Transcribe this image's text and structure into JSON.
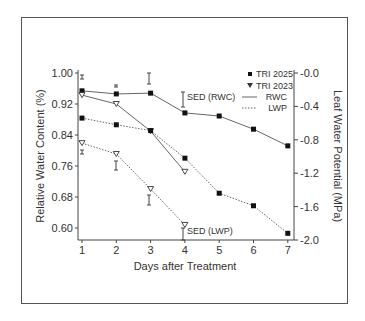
{
  "chart_data": {
    "type": "line",
    "title": "",
    "xlabel": "Days after Treatment",
    "ylabel": "Relative Water Content (%)",
    "y2label": "Leaf Water Potential (MPa)",
    "x": [
      1,
      2,
      3,
      4,
      5,
      6,
      7
    ],
    "x_ticks": [
      "1",
      "2",
      "3",
      "4",
      "5",
      "6",
      "7"
    ],
    "ylim": [
      0.6,
      1.0
    ],
    "y_ticks": [
      "1.00",
      "0.92",
      "0.84",
      "0.76",
      "0.68",
      "0.60"
    ],
    "y2lim": [
      -2.0,
      0.0
    ],
    "y2_ticks": [
      "-0.0",
      "-0.4",
      "-0.8",
      "-1.2",
      "-1.6",
      "-2.0"
    ],
    "grid": false,
    "legend_position": "upper right",
    "legend": [
      {
        "label": "TRI 2025",
        "marker": "square"
      },
      {
        "label": "TRI 2023",
        "marker": "triangle-down"
      },
      {
        "label": "RWC",
        "line": "solid"
      },
      {
        "label": "LWP",
        "line": "dotted"
      }
    ],
    "series": [
      {
        "name": "TRI 2025 RWC",
        "axis": "left",
        "x": [
          1,
          2,
          3,
          4,
          5,
          6,
          7
        ],
        "values": [
          0.954,
          0.946,
          0.948,
          0.897,
          0.889,
          0.855,
          0.812
        ]
      },
      {
        "name": "TRI 2023 RWC",
        "axis": "left",
        "x": [
          1,
          2,
          3,
          4
        ],
        "values": [
          0.943,
          0.92,
          0.85,
          0.745
        ]
      },
      {
        "name": "TRI 2025 LWP",
        "axis": "right",
        "x": [
          1,
          2,
          3,
          4,
          5,
          6,
          7
        ],
        "values": [
          -0.54,
          -0.62,
          -0.69,
          -1.02,
          -1.44,
          -1.59,
          -1.92
        ]
      },
      {
        "name": "TRI 2023 LWP",
        "axis": "right",
        "x": [
          1,
          2,
          3,
          4
        ],
        "values": [
          -0.84,
          -0.97,
          -1.39,
          -1.82
        ]
      }
    ],
    "annotations": [
      "SED (RWC)",
      "SED (LWP)"
    ]
  }
}
